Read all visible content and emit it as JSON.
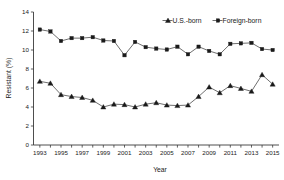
{
  "chart_data": {
    "type": "line",
    "title": "",
    "xlabel": "Year",
    "ylabel": "Resistant (%)",
    "xlim": [
      1992.4,
      2015.6
    ],
    "ylim": [
      0,
      14
    ],
    "yticks": [
      0,
      2,
      4,
      6,
      8,
      10,
      12,
      14
    ],
    "ytick_labels": [
      "0",
      "2",
      "4",
      "6",
      "8",
      "10",
      "12",
      "14"
    ],
    "xticks": [
      1993,
      1994,
      1995,
      1996,
      1997,
      1998,
      1999,
      2000,
      2001,
      2002,
      2003,
      2004,
      2005,
      2006,
      2007,
      2008,
      2009,
      2010,
      2011,
      2012,
      2013,
      2014,
      2015
    ],
    "xtick_labels": [
      "1993",
      "",
      "1995",
      "",
      "1997",
      "",
      "1999",
      "",
      "2001",
      "",
      "2003",
      "",
      "2005",
      "",
      "2007",
      "",
      "2009",
      "",
      "2011",
      "",
      "2013",
      "",
      "2015"
    ],
    "grid": false,
    "legend_position": "top-right",
    "x": [
      1993,
      1994,
      1995,
      1996,
      1997,
      1998,
      1999,
      2000,
      2001,
      2002,
      2003,
      2004,
      2005,
      2006,
      2007,
      2008,
      2009,
      2010,
      2011,
      2012,
      2013,
      2014,
      2015
    ],
    "series": [
      {
        "name": "U.S.-born",
        "marker": "triangle",
        "values": [
          6.7,
          6.5,
          5.3,
          5.1,
          5.0,
          4.7,
          4.0,
          4.3,
          4.25,
          4.0,
          4.3,
          4.45,
          4.2,
          4.15,
          4.2,
          5.1,
          6.1,
          5.5,
          6.25,
          5.95,
          5.65,
          7.4,
          6.4
        ]
      },
      {
        "name": "Foreign-born",
        "marker": "square",
        "values": [
          12.15,
          11.95,
          10.95,
          11.25,
          11.25,
          11.35,
          11.0,
          10.95,
          9.45,
          10.85,
          10.3,
          10.15,
          10.05,
          10.35,
          9.55,
          10.35,
          9.9,
          9.55,
          10.65,
          10.7,
          10.75,
          10.1,
          10.0
        ]
      }
    ]
  },
  "legend": {
    "items": [
      {
        "label": "U.S.-born",
        "marker": "triangle-marker"
      },
      {
        "label": "Foreign-born",
        "marker": "square-marker"
      }
    ]
  }
}
